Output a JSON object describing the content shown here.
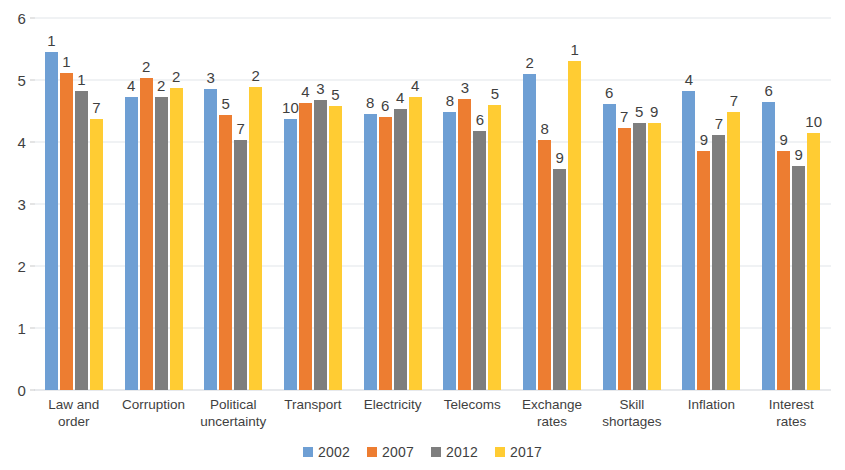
{
  "chart_data": {
    "type": "bar",
    "title": "",
    "subtitle": "",
    "xlabel": "",
    "ylabel": "",
    "ylim": [
      0,
      6
    ],
    "ytick_step": 1,
    "yticks": [
      "0",
      "1",
      "2",
      "3",
      "4",
      "5",
      "6"
    ],
    "grid": true,
    "legend_position": "bottom",
    "categories": [
      "Law and order",
      "Corruption",
      "Political uncertainty",
      "Transport",
      "Electricity",
      "Telecoms",
      "Exchange rates",
      "Skill shortages",
      "Inflation",
      "Interest rates"
    ],
    "series": [
      {
        "name": "2002",
        "color": "#6E9FD4",
        "values": [
          5.45,
          4.73,
          4.85,
          4.37,
          4.45,
          4.48,
          5.1,
          4.62,
          4.82,
          4.65
        ],
        "point_labels": [
          "1",
          "4",
          "3",
          "10",
          "8",
          "8",
          "2",
          "6",
          "4",
          "6"
        ]
      },
      {
        "name": "2007",
        "color": "#ED7D31",
        "values": [
          5.12,
          5.03,
          4.43,
          4.63,
          4.4,
          4.7,
          4.03,
          4.23,
          3.85,
          3.85
        ],
        "point_labels": [
          "1",
          "2",
          "5",
          "4",
          "6",
          "3",
          "8",
          "7",
          "9",
          "9"
        ]
      },
      {
        "name": "2012",
        "color": "#7E7E7E",
        "values": [
          4.82,
          4.73,
          4.03,
          4.68,
          4.53,
          4.18,
          3.57,
          4.3,
          4.12,
          3.62
        ],
        "point_labels": [
          "1",
          "2",
          "7",
          "3",
          "4",
          "6",
          "9",
          "5",
          "7",
          "9"
        ]
      },
      {
        "name": "2017",
        "color": "#FFCC33",
        "values": [
          4.37,
          4.87,
          4.88,
          4.58,
          4.73,
          4.6,
          5.3,
          4.3,
          4.48,
          4.15
        ],
        "point_labels": [
          "7",
          "2",
          "2",
          "5",
          "4",
          "5",
          "1",
          "9",
          "7",
          "10"
        ]
      }
    ]
  },
  "legend": {
    "items": [
      {
        "label": "2002",
        "color": "#6E9FD4"
      },
      {
        "label": "2007",
        "color": "#ED7D31"
      },
      {
        "label": "2012",
        "color": "#7E7E7E"
      },
      {
        "label": "2017",
        "color": "#FFCC33"
      }
    ]
  }
}
